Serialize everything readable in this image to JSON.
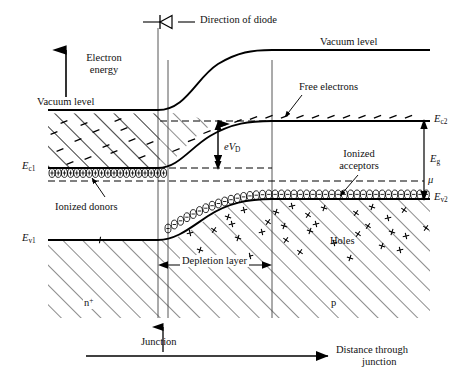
{
  "figure": {
    "title_note": "Energy band diagram of a p-n junction diode",
    "diode_caption": "Direction of diode",
    "axis_y_label_line1": "Electron",
    "axis_y_label_line2": "energy",
    "axis_x_label_line1": "Distance through",
    "axis_x_label_line2": "junction",
    "vacuum_level_left": "Vacuum level",
    "vacuum_level_right": "Vacuum level",
    "free_electrons": "Free electrons",
    "ionized_donors": "Ionized donors",
    "ionized_acceptors_line1": "Ionized",
    "ionized_acceptors_line2": "acceptors",
    "holes": "Holes",
    "depletion_layer": "Depletion layer",
    "junction": "Junction",
    "region_n": "n",
    "region_n_sup": "+",
    "region_p": "p",
    "built_in_potential_e": "e",
    "built_in_potential_v": "V",
    "built_in_potential_sub": "D",
    "chemical_potential": "μ",
    "band_gap_e": "E",
    "band_gap_sub": "g",
    "ec1_e": "E",
    "ec1_sub": "c1",
    "ec2_e": "E",
    "ec2_sub": "c2",
    "ev1_e": "E",
    "ev1_sub": "v1",
    "ev2_e": "E",
    "ev2_sub": "v2"
  },
  "chart_data": {
    "type": "line",
    "xlabel": "Distance through junction",
    "ylabel": "Electron energy",
    "grid": false,
    "legend": "none",
    "annotations": [
      "Direction of diode",
      "Vacuum level",
      "Free electrons",
      "Ionized donors",
      "Ionized acceptors",
      "Holes",
      "Depletion layer",
      "Junction",
      "eV_D",
      "E_g",
      "mu",
      "n+",
      "p"
    ],
    "regions": [
      {
        "name": "n+",
        "x_range": [
          48,
          160
        ],
        "doping": "heavily n-type"
      },
      {
        "name": "depletion layer",
        "x_range": [
          160,
          272
        ],
        "doping": "space charge"
      },
      {
        "name": "p",
        "x_range": [
          272,
          430
        ],
        "doping": "p-type"
      }
    ],
    "series": [
      {
        "name": "Vacuum level",
        "x": [
          48,
          160,
          200,
          240,
          272,
          430
        ],
        "y": [
          110,
          110,
          72,
          56,
          52,
          52
        ]
      },
      {
        "name": "E_c (conduction band edge)",
        "x": [
          48,
          160,
          200,
          240,
          272,
          430
        ],
        "y": [
          168,
          168,
          145,
          128,
          123,
          123
        ]
      },
      {
        "name": "E_v (valence band edge)",
        "x": [
          48,
          160,
          200,
          240,
          272,
          430
        ],
        "y": [
          239,
          239,
          220,
          205,
          200,
          200
        ]
      },
      {
        "name": "mu (Fermi level)",
        "x": [
          48,
          430
        ],
        "y": [
          181,
          181
        ]
      }
    ],
    "markers": [
      {
        "name": "ionized donors",
        "symbol": "circled plus",
        "x_range": [
          48,
          160
        ],
        "y": 172
      },
      {
        "name": "ionized acceptors",
        "symbol": "circled minus",
        "x_range": [
          166,
          430
        ],
        "y": 200
      },
      {
        "name": "free electrons",
        "symbol": "minus",
        "x_range": [
          48,
          430
        ],
        "y": 123
      },
      {
        "name": "holes",
        "symbol": "plus",
        "x_range": [
          170,
          430
        ],
        "y": 215
      }
    ]
  }
}
